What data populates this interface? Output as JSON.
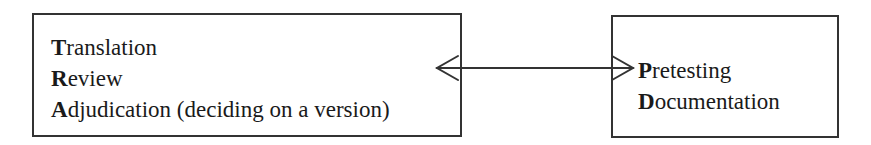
{
  "left_box": {
    "items": [
      {
        "initial": "T",
        "rest": "ranslation"
      },
      {
        "initial": "R",
        "rest": "eview"
      },
      {
        "initial": "A",
        "rest": "djudication (deciding on a version)"
      }
    ]
  },
  "right_box": {
    "items": [
      {
        "initial": "P",
        "rest": "retesting"
      },
      {
        "initial": "D",
        "rest": "ocumentation"
      }
    ]
  },
  "connector": {
    "type": "bidirectional-arrow",
    "color": "#333333"
  }
}
